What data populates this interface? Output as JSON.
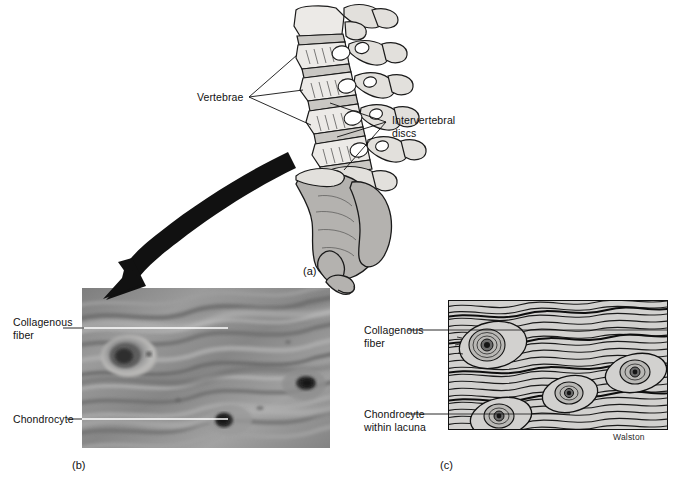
{
  "figure": {
    "title_signature": "Walston",
    "panels": [
      {
        "id": "a",
        "caption": "(a)",
        "description": "lumbar vertebral column with sacrum",
        "labels": [
          {
            "name": "vertebrae",
            "text": "Vertebrae"
          },
          {
            "name": "intervertebral-discs",
            "line1": "Intervertebral",
            "line2": "discs"
          }
        ]
      },
      {
        "id": "b",
        "caption": "(b)",
        "description": "light micrograph of fibrocartilage",
        "labels": [
          {
            "name": "collagenous-fiber",
            "line1": "Collagenous",
            "line2": "fiber"
          },
          {
            "name": "chondrocyte",
            "line1": "Chondrocyte",
            "line2": ""
          }
        ]
      },
      {
        "id": "c",
        "caption": "(c)",
        "description": "line drawing of fibrocartilage",
        "labels": [
          {
            "name": "collagenous-fiber",
            "line1": "Collagenous",
            "line2": "fiber"
          },
          {
            "name": "chondrocyte-within-lacuna",
            "line1": "Chondrocyte",
            "line2": "within lacuna"
          }
        ]
      }
    ]
  },
  "labels": {
    "vertebrae": "Vertebrae",
    "intervertebral_discs_line1": "Intervertebral",
    "intervertebral_discs_line2": "discs",
    "b_collagenous_line1": "Collagenous",
    "b_collagenous_line2": "fiber",
    "b_chondrocyte": "Chondrocyte",
    "c_collagenous_line1": "Collagenous",
    "c_collagenous_line2": "fiber",
    "c_chondrocyte_line1": "Chondrocyte",
    "c_chondrocyte_line2": "within lacuna"
  },
  "captions": {
    "a": "(a)",
    "b": "(b)",
    "c": "(c)"
  },
  "credit": {
    "artist": "Walston"
  },
  "colors": {
    "background": "#ffffff",
    "ink": "#111111",
    "bone_fill": "#e9e7e4",
    "sacrum_fill": "#b3b1ae",
    "micrograph_base": "#8d8d8d",
    "drawing_base": "#cfcfcf",
    "leader_white": "#ffffff"
  }
}
